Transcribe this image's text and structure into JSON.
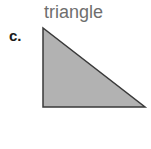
{
  "item": {
    "letter_label": "c.",
    "shape_name": "triangle",
    "icon_name": "right-triangle-shape"
  },
  "colors": {
    "background": "#ffffff",
    "shape_fill": "#b2b2b2",
    "shape_stroke": "#3a3a3a",
    "label_text": "#6e6e6e",
    "letter_text": "#1a1a1a"
  },
  "figure": {
    "type": "right-triangle",
    "vertices": [
      {
        "name": "apex-top-left",
        "x": 5,
        "y": 5
      },
      {
        "name": "right-angle-bottom-left",
        "x": 5,
        "y": 84
      },
      {
        "name": "bottom-right",
        "x": 107,
        "y": 84
      }
    ],
    "stroke_width": 1.5
  }
}
